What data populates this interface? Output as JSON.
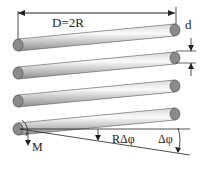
{
  "diagram": {
    "type": "helical spring coil schematic",
    "labels": {
      "diameter": "D=2R",
      "wire_diameter": "d",
      "moment": "M",
      "arc_displacement": "RΔφ",
      "angle": "Δφ"
    },
    "coils": [
      {
        "left": [
          18,
          45
        ],
        "right": [
          175,
          30
        ]
      },
      {
        "left": [
          18,
          73
        ],
        "right": [
          175,
          58
        ]
      },
      {
        "left": [
          18,
          101
        ],
        "right": [
          175,
          86
        ]
      },
      {
        "left": [
          18,
          129
        ],
        "right": [
          175,
          114
        ]
      }
    ],
    "colors": {
      "rod_light": "#f2f2f2",
      "rod_dark": "#9a9a9a",
      "end_cap": "#8a8a8a",
      "line": "#222222"
    }
  }
}
